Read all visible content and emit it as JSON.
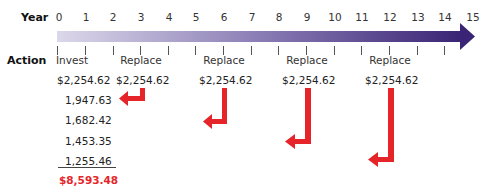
{
  "labels": {
    "year": "Year",
    "action": "Action"
  },
  "timeline": {
    "years": [
      "0",
      "1",
      "2",
      "3",
      "4",
      "5",
      "6",
      "7",
      "8",
      "9",
      "10",
      "11",
      "12",
      "13",
      "14",
      "15"
    ],
    "bar_color_start": "#d8d4e8",
    "bar_color_end": "#3f2a7c"
  },
  "actions": [
    {
      "year": 0,
      "label": "Invest",
      "amount": "$2,254.62"
    },
    {
      "year": 3,
      "label": "Replace",
      "amount": "$2,254.62"
    },
    {
      "year": 6,
      "label": "Replace",
      "amount": "$2,254.62"
    },
    {
      "year": 9,
      "label": "Replace",
      "amount": "$2,254.62"
    },
    {
      "year": 12,
      "label": "Replace",
      "amount": "$2,254.62"
    }
  ],
  "present_values": [
    "1,947.63",
    "1,682.42",
    "1,453.35",
    "1,255.46"
  ],
  "total": "$8,593.48",
  "colors": {
    "arrow": "#e5252a",
    "total": "#e5252a"
  }
}
